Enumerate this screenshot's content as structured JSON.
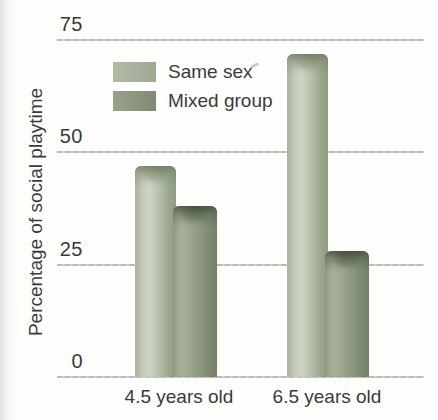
{
  "chart_data": {
    "type": "bar",
    "title": "",
    "categories": [
      "4.5 years old",
      "6.5 years old"
    ],
    "series": [
      {
        "name": "Same sex",
        "values": [
          47,
          72
        ]
      },
      {
        "name": "Mixed group",
        "values": [
          38,
          28
        ]
      }
    ],
    "xlabel": "",
    "ylabel": "Percentage of social playtime",
    "yticks": [
      75,
      50,
      25,
      0
    ],
    "ylim": [
      0,
      75
    ],
    "grid": true,
    "legend_position": "inside-upper-left",
    "bar_style": "3d-cylinder-gradient"
  },
  "colors": {
    "background": "#fefefd",
    "text": "#3a3a3a",
    "gridline": "#b3b6ad",
    "series_styles": [
      {
        "body_stops": [
          [
            "#a9b29c",
            0
          ],
          [
            "#c6ccba",
            20
          ],
          [
            "#ced4c4",
            36
          ],
          [
            "#b7c0ac",
            58
          ],
          [
            "#9aa58e",
            84
          ],
          [
            "#919c86",
            100
          ]
        ],
        "cap_strong": "rgba(96,108,82,0.55)",
        "cap_soft": "rgba(96,108,82,0.25)",
        "legend_swatch": [
          "#b2bba6",
          "#9da894"
        ]
      },
      {
        "body_stops": [
          [
            "#8e9883",
            0
          ],
          [
            "#a7b09b",
            18
          ],
          [
            "#99a38c",
            44
          ],
          [
            "#859178",
            72
          ],
          [
            "#737f67",
            100
          ]
        ],
        "cap_strong": "rgba(52,63,44,0.6)",
        "cap_soft": "rgba(52,63,44,0.28)",
        "legend_swatch": [
          "#97a28b",
          "#7e8a72"
        ]
      }
    ]
  }
}
